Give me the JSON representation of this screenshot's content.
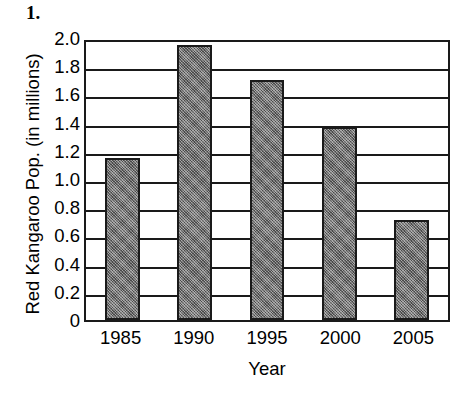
{
  "problem": {
    "number": "1."
  },
  "chart_data": {
    "type": "bar",
    "title": "",
    "xlabel": "Year",
    "ylabel": "Red Kangaroo Pop. (in millions)",
    "categories": [
      "1985",
      "1990",
      "1995",
      "2000",
      "2005"
    ],
    "values": [
      1.15,
      1.95,
      1.7,
      1.37,
      0.71
    ],
    "series": [
      {
        "name": "Red Kangaroo Population",
        "values": [
          1.15,
          1.95,
          1.7,
          1.37,
          0.71
        ]
      }
    ],
    "ylim": [
      0,
      2.0
    ],
    "ytick_values": [
      2.0,
      1.8,
      1.6,
      1.4,
      1.2,
      1.0,
      0.8,
      0.6,
      0.4,
      0.2,
      0
    ],
    "ytick_labels": [
      "2.0",
      "1.8",
      "1.6",
      "1.4",
      "1.2",
      "1.0",
      "0.8",
      "0.6",
      "0.4",
      "0.2",
      "0"
    ],
    "grid": true,
    "grid_axis": "y",
    "legend": null,
    "bar_color": "#6e6e6e",
    "bar_edge_color": "#1a1a1a",
    "axis_color": "#1a1a1a",
    "background_color": "#ffffff"
  }
}
